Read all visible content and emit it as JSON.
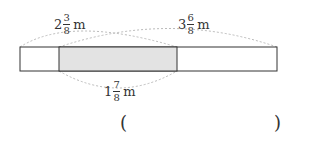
{
  "diagram": {
    "labels": {
      "left": {
        "whole": "2",
        "num": "3",
        "den": "8",
        "unit": "m"
      },
      "right": {
        "whole": "3",
        "num": "6",
        "den": "8",
        "unit": "m"
      },
      "overlap": {
        "whole": "1",
        "num": "7",
        "den": "8",
        "unit": "m"
      }
    },
    "answer": {
      "open": "(",
      "close": ")"
    },
    "colors": {
      "shaded": "#e3e3e3",
      "stroke": "#333333",
      "dotted": "#bbbbbb"
    }
  }
}
